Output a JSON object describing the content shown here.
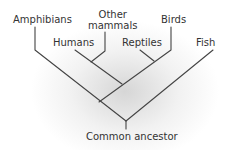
{
  "diagram": {
    "type": "cladogram",
    "line_color": "#444444",
    "text_color": "#333333",
    "taxa": [
      {
        "id": "amphibians",
        "label": "Amphibians"
      },
      {
        "id": "other-mammals",
        "label_line1": "Other",
        "label_line2": "mammals"
      },
      {
        "id": "humans",
        "label": "Humans"
      },
      {
        "id": "reptiles",
        "label": "Reptiles"
      },
      {
        "id": "birds",
        "label": "Birds"
      },
      {
        "id": "fish",
        "label": "Fish"
      }
    ],
    "root": {
      "label": "Common ancestor"
    }
  }
}
